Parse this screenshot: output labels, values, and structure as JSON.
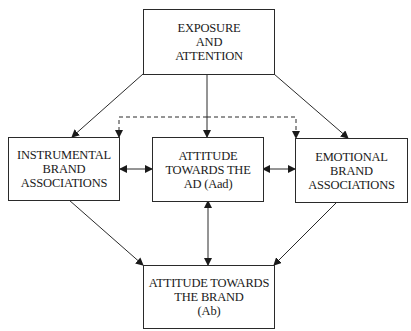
{
  "diagram": {
    "nodes": {
      "exposure": {
        "lines": [
          "EXPOSURE",
          "AND",
          "ATTENTION"
        ]
      },
      "instrumental": {
        "lines": [
          "INSTRUMENTAL",
          "BRAND",
          "ASSOCIATIONS"
        ]
      },
      "aad": {
        "lines": [
          "ATTITUDE",
          "TOWARDS THE",
          "AD (Aad)"
        ]
      },
      "emotional": {
        "lines": [
          "EMOTIONAL",
          "BRAND",
          "ASSOCIATIONS"
        ]
      },
      "ab": {
        "lines": [
          "ATTITUDE TOWARDS",
          "THE BRAND",
          "(Ab)"
        ]
      }
    },
    "edges": [
      {
        "from": "exposure",
        "to": "instrumental",
        "style": "solid",
        "direction": "forward"
      },
      {
        "from": "exposure",
        "to": "aad",
        "style": "solid",
        "direction": "forward"
      },
      {
        "from": "exposure",
        "to": "emotional",
        "style": "solid",
        "direction": "forward"
      },
      {
        "from": "exposure",
        "to": "instrumental",
        "style": "dashed",
        "direction": "forward",
        "note": "dashed branch"
      },
      {
        "from": "exposure",
        "to": "emotional",
        "style": "dashed",
        "direction": "forward",
        "note": "dashed branch"
      },
      {
        "from": "instrumental",
        "to": "aad",
        "style": "solid",
        "direction": "both"
      },
      {
        "from": "aad",
        "to": "emotional",
        "style": "solid",
        "direction": "both"
      },
      {
        "from": "instrumental",
        "to": "ab",
        "style": "solid",
        "direction": "forward"
      },
      {
        "from": "aad",
        "to": "ab",
        "style": "solid",
        "direction": "both"
      },
      {
        "from": "emotional",
        "to": "ab",
        "style": "solid",
        "direction": "forward"
      }
    ],
    "colors": {
      "stroke": "#2a2a2a",
      "text": "#1a1a1a",
      "background": "#ffffff"
    }
  }
}
